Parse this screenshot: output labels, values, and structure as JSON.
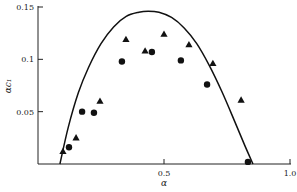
{
  "chart_data": {
    "type": "scatter",
    "title": "",
    "xlabel": "α",
    "ylabel": "αc₁",
    "xlim": [
      0,
      1.0
    ],
    "ylim": [
      0,
      0.15
    ],
    "grid": false,
    "legend": null,
    "x_ticks": [
      {
        "value": 0.5,
        "label": "0.5"
      },
      {
        "value": 1.0,
        "label": "1.0"
      }
    ],
    "y_ticks": [
      {
        "value": 0.05,
        "label": "0.05"
      },
      {
        "value": 0.1,
        "label": "0.1"
      },
      {
        "value": 0.15,
        "label": "0.15"
      }
    ],
    "series": [
      {
        "name": "triangles",
        "marker": "triangle",
        "points": [
          [
            0.099,
            0.012
          ],
          [
            0.151,
            0.025
          ],
          [
            0.246,
            0.06
          ],
          [
            0.349,
            0.119
          ],
          [
            0.425,
            0.108
          ],
          [
            0.5,
            0.124
          ],
          [
            0.599,
            0.114
          ],
          [
            0.694,
            0.096
          ],
          [
            0.806,
            0.061
          ]
        ]
      },
      {
        "name": "circles",
        "marker": "circle",
        "points": [
          [
            0.123,
            0.016
          ],
          [
            0.175,
            0.05
          ],
          [
            0.222,
            0.049
          ],
          [
            0.333,
            0.098
          ],
          [
            0.452,
            0.107
          ],
          [
            0.567,
            0.099
          ],
          [
            0.671,
            0.076
          ],
          [
            0.833,
            0.002
          ]
        ]
      },
      {
        "name": "theoretical curve",
        "marker": "line",
        "points": [
          [
            0.087,
            0.0
          ],
          [
            0.12,
            0.035
          ],
          [
            0.16,
            0.068
          ],
          [
            0.2,
            0.092
          ],
          [
            0.25,
            0.115
          ],
          [
            0.3,
            0.131
          ],
          [
            0.35,
            0.141
          ],
          [
            0.4,
            0.145
          ],
          [
            0.437,
            0.146
          ],
          [
            0.48,
            0.145
          ],
          [
            0.53,
            0.14
          ],
          [
            0.58,
            0.13
          ],
          [
            0.63,
            0.115
          ],
          [
            0.68,
            0.094
          ],
          [
            0.73,
            0.069
          ],
          [
            0.78,
            0.041
          ],
          [
            0.82,
            0.018
          ],
          [
            0.853,
            0.0
          ]
        ]
      }
    ]
  }
}
